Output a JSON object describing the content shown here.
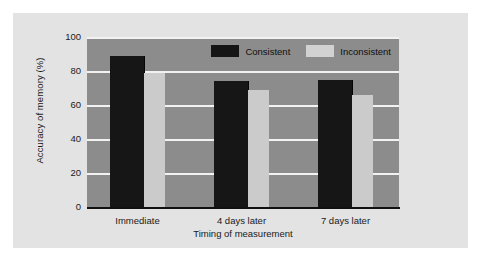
{
  "chart_data": {
    "type": "bar",
    "title": "",
    "xlabel": "Timing of measurement",
    "ylabel": "Accuracy of memory (%)",
    "categories": [
      "Immediate",
      "4 days later",
      "7 days later"
    ],
    "series": [
      {
        "name": "Consistent",
        "color": "#161616",
        "values": [
          89,
          74,
          75
        ]
      },
      {
        "name": "Inconsistent",
        "color": "#cbcbcb",
        "values": [
          79,
          69,
          66
        ]
      }
    ],
    "ylim": [
      0,
      100
    ],
    "yticks": [
      "100",
      "80",
      "60",
      "40",
      "20",
      "0"
    ],
    "ytick_values": [
      100,
      80,
      60,
      40,
      20,
      0
    ],
    "grid": true,
    "legend_position": "top-right",
    "plot_background": "#8c8c8c",
    "gridline_color": "#f2f2f2",
    "figure_background": "#e3e3e3"
  },
  "legend": {
    "items": [
      {
        "label": "Consistent",
        "swatch": "black-swatch"
      },
      {
        "label": "Inconsistent",
        "swatch": "gray-swatch"
      }
    ]
  }
}
